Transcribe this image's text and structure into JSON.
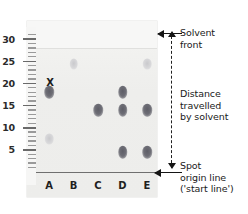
{
  "figure": {
    "kind": "chromatography-diagram"
  },
  "axis": {
    "unit_label": "",
    "labels": [
      "30",
      "25",
      "20",
      "15",
      "10",
      "5"
    ],
    "major_values": [
      30,
      25,
      20,
      15,
      10,
      5
    ],
    "minor_step": 1,
    "range_min": 0,
    "range_max": 31
  },
  "lanes": {
    "labels": [
      "A",
      "B",
      "C",
      "D",
      "E"
    ]
  },
  "marks": {
    "x_label": "X"
  },
  "annotations": {
    "solvent_front_line1": "Solvent",
    "solvent_front_line2": "front",
    "distance_line1": "Distance",
    "distance_line2": "travelled",
    "distance_line3": "by solvent",
    "origin_line1": "Spot",
    "origin_line2": "origin line",
    "origin_line3": "('start line')"
  },
  "colors": {
    "paper": "#f0f0ee",
    "spot_dark": "#6e6e76",
    "spot_faint": "#c9c9cc",
    "ink": "#151515",
    "rule": "#6f6f6f"
  },
  "chart_data": {
    "type": "scatter",
    "xlabel": "Lane",
    "ylabel": "Distance from origin",
    "categories": [
      "A",
      "B",
      "C",
      "D",
      "E"
    ],
    "ylim": [
      0,
      31
    ],
    "yticks": [
      5,
      10,
      15,
      20,
      25,
      30
    ],
    "grid": false,
    "legend": "none",
    "solvent_front": 28,
    "origin": 0,
    "annotations": [
      {
        "text": "Solvent front",
        "y": 28
      },
      {
        "text": "Distance travelled by solvent",
        "from": 0,
        "to": 28
      },
      {
        "text": "Spot origin line ('start line')",
        "y": 0
      },
      {
        "text": "X",
        "lane": "A",
        "y": 20
      }
    ],
    "series": [
      {
        "name": "A",
        "lane": "A",
        "spots": [
          {
            "y": 18.0,
            "intensity": "dark"
          },
          {
            "y": 7.5,
            "intensity": "faint"
          }
        ]
      },
      {
        "name": "B",
        "lane": "B",
        "spots": [
          {
            "y": 24.5,
            "intensity": "faint"
          }
        ]
      },
      {
        "name": "C",
        "lane": "C",
        "spots": [
          {
            "y": 14.0,
            "intensity": "dark"
          }
        ]
      },
      {
        "name": "D",
        "lane": "D",
        "spots": [
          {
            "y": 18.0,
            "intensity": "dark"
          },
          {
            "y": 14.0,
            "intensity": "dark"
          },
          {
            "y": 4.5,
            "intensity": "dark"
          }
        ]
      },
      {
        "name": "E",
        "lane": "E",
        "spots": [
          {
            "y": 24.5,
            "intensity": "faint"
          },
          {
            "y": 14.0,
            "intensity": "dark"
          },
          {
            "y": 4.5,
            "intensity": "dark"
          }
        ]
      }
    ]
  }
}
